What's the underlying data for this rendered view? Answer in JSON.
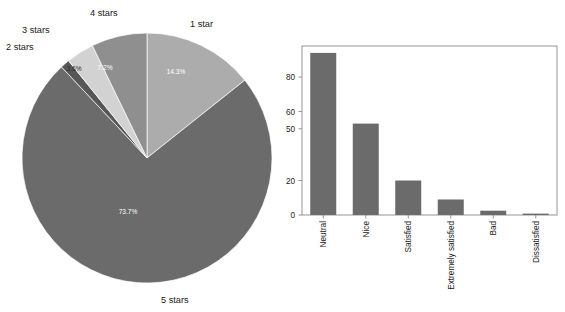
{
  "chart_data": [
    {
      "type": "pie",
      "title": "",
      "name": "star-rating-distribution",
      "categories": [
        "1 star",
        "2 stars",
        "3 stars",
        "4 stars",
        "5 stars"
      ],
      "values": [
        14.3,
        1.2,
        3.6,
        7.2,
        73.7
      ],
      "value_labels": [
        "14.3%",
        "1.2%",
        "3.6%",
        "7.2%",
        "73.7%"
      ],
      "colors": [
        "#acacac",
        "#575757",
        "#d2d2d2",
        "#8f8f8f",
        "#6b6b6b"
      ],
      "label_position": "outside",
      "value_label_position": "inside",
      "start_angle_deg": 0,
      "direction": "clockwise",
      "legend": "none",
      "grid": false
    },
    {
      "type": "bar",
      "title": "",
      "name": "satisfaction-counts",
      "categories": [
        "Neutral",
        "Nice",
        "Satisfied",
        "Extremely satisfied",
        "Bad",
        "Dissatisfied"
      ],
      "values": [
        94,
        53,
        20,
        9,
        2.5,
        0.8
      ],
      "xlabel": "",
      "ylabel": "",
      "ylim": [
        0,
        98
      ],
      "yticks": [
        0,
        20,
        50,
        60,
        80
      ],
      "ytick_labels": [
        "0",
        "20",
        "50",
        "60",
        "80"
      ],
      "bar_color": "#6b6b6b",
      "xtick_rotation_deg": 90,
      "grid": false,
      "legend": "none",
      "frame": true
    }
  ],
  "pie": {
    "slices": [
      {
        "category": "1 star",
        "pct_label": "14.3%",
        "color": "#acacac"
      },
      {
        "category": "2 stars",
        "pct_label": "1.2%",
        "color": "#575757"
      },
      {
        "category": "3 stars",
        "pct_label": "3.6%",
        "color": "#d2d2d2"
      },
      {
        "category": "4 stars",
        "pct_label": "7.2%",
        "color": "#8f8f8f"
      },
      {
        "category": "5 stars",
        "pct_label": "73.7%",
        "color": "#6b6b6b"
      }
    ],
    "labels": {
      "one_star": "1 star",
      "two_stars": "2 stars",
      "three_stars": "3 stars",
      "four_stars": "4 stars",
      "five_stars": "5 stars"
    },
    "percents": {
      "one_star": "14.3%",
      "two_stars": "1.2%",
      "three_stars": "3.6%",
      "four_stars": "7.2%",
      "five_stars": "73.7%"
    }
  },
  "bar": {
    "yticks": {
      "t0": "0",
      "t1": "20",
      "t2": "50",
      "t3": "60",
      "t4": "80"
    },
    "xticks": {
      "c0": "Neutral",
      "c1": "Nice",
      "c2": "Satisfied",
      "c3": "Extremely satisfied",
      "c4": "Bad",
      "c5": "Dissatisfied"
    }
  }
}
